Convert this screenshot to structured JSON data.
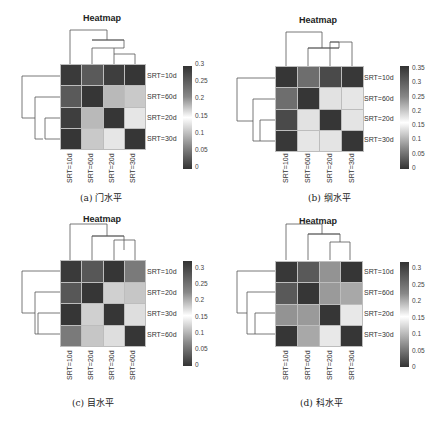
{
  "chart_data": [
    {
      "type": "heatmap",
      "title": "Heatmap",
      "caption": "(a) 门水平",
      "rows": [
        "SRT=10d",
        "SRT=60d",
        "SRT=20d",
        "SRT=30d"
      ],
      "cols": [
        "SRT=10d",
        "SRT=60d",
        "SRT=20d",
        "SRT=30d"
      ],
      "values": [
        [
          0.0,
          0.27,
          0.3,
          0.31
        ],
        [
          0.27,
          0.0,
          0.21,
          0.2
        ],
        [
          0.3,
          0.21,
          0.0,
          0.18
        ],
        [
          0.31,
          0.2,
          0.18,
          0.0
        ]
      ],
      "colorbar": {
        "ticks": [
          "0.3",
          "0.25",
          "0.2",
          "0.15",
          "0.1",
          "0.05",
          "0"
        ],
        "min": 0,
        "max": 0.31
      }
    },
    {
      "type": "heatmap",
      "title": "Heatmap",
      "caption": "(b) 纲水平",
      "rows": [
        "SRT=10d",
        "SRT=60d",
        "SRT=20d",
        "SRT=30d"
      ],
      "cols": [
        "SRT=10d",
        "SRT=60d",
        "SRT=20d",
        "SRT=30d"
      ],
      "values": [
        [
          0.0,
          0.28,
          0.33,
          0.36
        ],
        [
          0.28,
          0.0,
          0.18,
          0.19
        ],
        [
          0.33,
          0.18,
          0.0,
          0.19
        ],
        [
          0.36,
          0.19,
          0.19,
          0.0
        ]
      ],
      "colorbar": {
        "ticks": [
          "0.35",
          "0.3",
          "0.25",
          "0.2",
          "0.15",
          "0.1",
          "0.05",
          "0"
        ],
        "min": 0,
        "max": 0.37
      }
    },
    {
      "type": "heatmap",
      "title": "Heatmap",
      "caption": "(c) 目水平",
      "rows": [
        "SRT=10d",
        "SRT=20d",
        "SRT=30d",
        "SRT=60d"
      ],
      "cols": [
        "SRT=10d",
        "SRT=20d",
        "SRT=30d",
        "SRT=60d"
      ],
      "values": [
        [
          0.0,
          0.28,
          0.32,
          0.25
        ],
        [
          0.28,
          0.0,
          0.2,
          0.22
        ],
        [
          0.32,
          0.2,
          0.0,
          0.19
        ],
        [
          0.25,
          0.22,
          0.19,
          0.0
        ]
      ],
      "colorbar": {
        "ticks": [
          "0.3",
          "0.25",
          "0.2",
          "0.15",
          "0.1",
          "0.05",
          "0"
        ],
        "min": 0,
        "max": 0.33
      }
    },
    {
      "type": "heatmap",
      "title": "Heatmap",
      "caption": "(d) 科水平",
      "rows": [
        "SRT=10d",
        "SRT=60d",
        "SRT=20d",
        "SRT=30d"
      ],
      "cols": [
        "SRT=10d",
        "SRT=60d",
        "SRT=20d",
        "SRT=30d"
      ],
      "values": [
        [
          0.0,
          0.28,
          0.25,
          0.32
        ],
        [
          0.28,
          0.0,
          0.24,
          0.23
        ],
        [
          0.25,
          0.24,
          0.0,
          0.18
        ],
        [
          0.32,
          0.23,
          0.18,
          0.0
        ]
      ],
      "colorbar": {
        "ticks": [
          "0.3",
          "0.25",
          "0.2",
          "0.15",
          "0.1",
          "0.05",
          "0"
        ],
        "min": 0,
        "max": 0.33
      }
    }
  ],
  "shades": {
    "a": [
      [
        "#3a3a3a",
        "#5a5a5a",
        "#3e3e3e",
        "#363636"
      ],
      [
        "#5a5a5a",
        "#363636",
        "#b9b9b9",
        "#c9c9c9"
      ],
      [
        "#3e3e3e",
        "#b9b9b9",
        "#363636",
        "#e6e6e6"
      ],
      [
        "#363636",
        "#c9c9c9",
        "#e6e6e6",
        "#363636"
      ]
    ],
    "b": [
      [
        "#363636",
        "#6e6e6e",
        "#4a4a4a",
        "#383838"
      ],
      [
        "#6e6e6e",
        "#363636",
        "#e2e2e2",
        "#e6e6e6"
      ],
      [
        "#4a4a4a",
        "#e2e2e2",
        "#363636",
        "#e4e4e4"
      ],
      [
        "#383838",
        "#e6e6e6",
        "#e4e4e4",
        "#363636"
      ]
    ],
    "c": [
      [
        "#3a3a3a",
        "#575757",
        "#363636",
        "#7a7a7a"
      ],
      [
        "#575757",
        "#363636",
        "#d0d0d0",
        "#c6c6c6"
      ],
      [
        "#363636",
        "#d0d0d0",
        "#363636",
        "#dedede"
      ],
      [
        "#7a7a7a",
        "#c6c6c6",
        "#dedede",
        "#363636"
      ]
    ],
    "d": [
      [
        "#383838",
        "#595959",
        "#939393",
        "#363636"
      ],
      [
        "#595959",
        "#363636",
        "#9a9a9a",
        "#a8a8a8"
      ],
      [
        "#939393",
        "#9a9a9a",
        "#363636",
        "#e8e8e8"
      ],
      [
        "#363636",
        "#a8a8a8",
        "#e8e8e8",
        "#363636"
      ]
    ]
  }
}
